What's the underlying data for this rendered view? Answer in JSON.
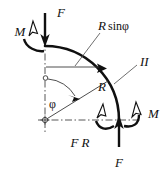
{
  "figure": {
    "labels": {
      "moment_top_left": "M",
      "force_top": "F",
      "r_sin_phi": "R sinφ",
      "r_sin_phi_r": "R",
      "r_sin_phi_rest": "sinφ",
      "radius": "R",
      "section": "II",
      "angle": "φ",
      "moment_bottom_left": "F R",
      "force_bottom": "F",
      "moment_bottom_right": "M"
    },
    "colors": {
      "ink": "#101010",
      "thin_line": "#3a3a3a",
      "leader": "#555555",
      "axis": "#444444",
      "background": "#ffffff"
    },
    "geometry": {
      "center_x": 45,
      "center_y": 120,
      "radius_px": 74,
      "arc_start": "top",
      "arc_end": "bottom-right",
      "angle_phi_deg": 58
    }
  }
}
